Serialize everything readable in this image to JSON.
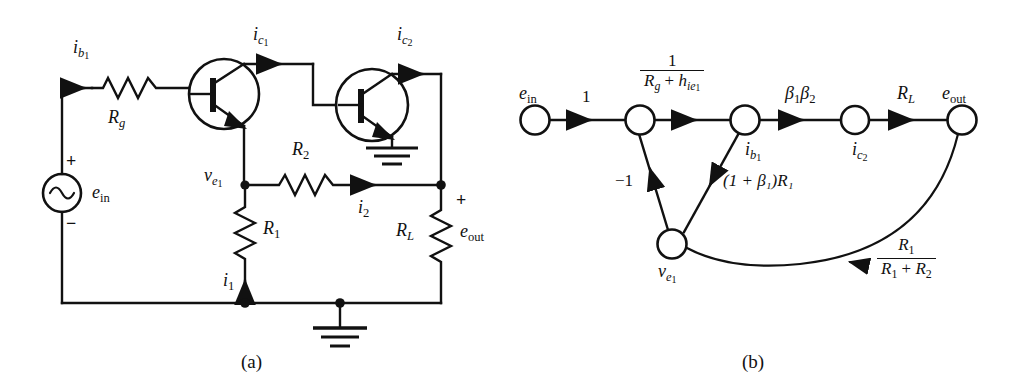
{
  "figure": {
    "captions": {
      "a": "(a)",
      "b": "(b)"
    },
    "colors": {
      "ink": "#111111",
      "background": "#ffffff"
    }
  },
  "circuit": {
    "name": "two-stage-transistor-amplifier",
    "source": {
      "symbol": "ac-source",
      "label_e": "e",
      "label_sub": "in",
      "plus": "+",
      "minus": "−"
    },
    "components": [
      {
        "id": "Rg",
        "kind": "resistor",
        "label_main": "R",
        "label_sub": "g"
      },
      {
        "id": "R1",
        "kind": "resistor",
        "label_main": "R",
        "label_sub": "1"
      },
      {
        "id": "R2",
        "kind": "resistor",
        "label_main": "R",
        "label_sub": "2"
      },
      {
        "id": "RL",
        "kind": "resistor",
        "label_main": "R",
        "label_sub": "L"
      },
      {
        "id": "Q1",
        "kind": "npn-transistor"
      },
      {
        "id": "Q2",
        "kind": "npn-transistor"
      }
    ],
    "currents": [
      {
        "id": "ib1",
        "main": "i",
        "sub": "b",
        "subsub": "1"
      },
      {
        "id": "ic1",
        "main": "i",
        "sub": "c",
        "subsub": "1"
      },
      {
        "id": "ic2",
        "main": "i",
        "sub": "c",
        "subsub": "2"
      },
      {
        "id": "i1",
        "main": "i",
        "sub": "1",
        "subsub": ""
      },
      {
        "id": "i2",
        "main": "i",
        "sub": "2",
        "subsub": ""
      }
    ],
    "nodes": [
      {
        "id": "ve1",
        "main": "v",
        "sub": "e",
        "subsub": "1"
      }
    ],
    "output": {
      "label_e": "e",
      "label_sub": "out",
      "polarity_plus": "+"
    },
    "ground_symbols": 2
  },
  "flowgraph": {
    "name": "signal-flow-graph",
    "nodes": [
      {
        "id": "ein",
        "main": "e",
        "sub": "in",
        "subsub": "",
        "sub_italic": false,
        "x": 535,
        "y": 120,
        "label_pos": "above"
      },
      {
        "id": "n2",
        "main": "",
        "sub": "",
        "subsub": "",
        "sub_italic": false,
        "x": 640,
        "y": 120,
        "label_pos": "none"
      },
      {
        "id": "ib1",
        "main": "i",
        "sub": "b",
        "subsub": "1",
        "sub_italic": true,
        "x": 745,
        "y": 120,
        "label_pos": "below"
      },
      {
        "id": "ic2",
        "main": "i",
        "sub": "c",
        "subsub": "2",
        "sub_italic": true,
        "x": 855,
        "y": 120,
        "label_pos": "below"
      },
      {
        "id": "eout",
        "main": "e",
        "sub": "out",
        "subsub": "",
        "sub_italic": false,
        "x": 962,
        "y": 120,
        "label_pos": "above"
      },
      {
        "id": "ve1",
        "main": "v",
        "sub": "e",
        "subsub": "1",
        "sub_italic": true,
        "x": 672,
        "y": 244,
        "label_pos": "below"
      }
    ],
    "branches": [
      {
        "from": "ein",
        "to": "n2",
        "gain_type": "plain",
        "gain": "1"
      },
      {
        "from": "n2",
        "to": "ib1",
        "gain_type": "fraction",
        "num": "1",
        "den_R": "R",
        "den_Rsub": "g",
        "den_plus": "+",
        "den_h": "h",
        "den_hsub": "ie",
        "den_hsubsub": "1"
      },
      {
        "from": "ib1",
        "to": "ic2",
        "gain_type": "plain",
        "gain": "β₁β₂",
        "gain_b": "β",
        "gain_b1": "1",
        "gain_b2": "2"
      },
      {
        "from": "ic2",
        "to": "eout",
        "gain_type": "plain",
        "gain_R": "R",
        "gain_Rsub": "L"
      },
      {
        "from": "ve1",
        "to": "n2",
        "gain_type": "plain",
        "gain": "−1"
      },
      {
        "from": "ve1",
        "to": "ib1",
        "gain_type": "paren",
        "gain": "(1 + β₁)R₁"
      },
      {
        "from": "eout",
        "to": "ve1",
        "gain_type": "fraction",
        "num_R": "R",
        "num_Rsub": "1",
        "den_R1": "R",
        "den_R1sub": "1",
        "den_plus": "+",
        "den_R2": "R",
        "den_R2sub": "2",
        "curved": true
      }
    ]
  }
}
